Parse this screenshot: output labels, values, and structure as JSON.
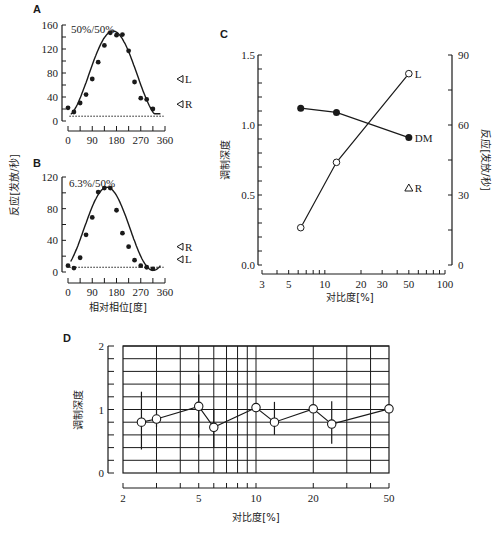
{
  "chart_data": [
    {
      "panel": "A",
      "type": "scatter",
      "title": "50%/50%",
      "xlabel": "相对相位[度]",
      "ylabel": "反应[发放/秒]",
      "xlim": [
        0,
        360
      ],
      "ylim": [
        0,
        160
      ],
      "xticks": [
        0,
        90,
        180,
        270,
        360
      ],
      "yticks": [
        0,
        40,
        80,
        120,
        160
      ],
      "points": {
        "x": [
          0,
          22,
          45,
          67,
          90,
          112,
          135,
          157,
          180,
          202,
          225,
          247,
          270,
          292,
          315
        ],
        "y": [
          22,
          15,
          30,
          44,
          70,
          98,
          126,
          147,
          143,
          144,
          117,
          65,
          38,
          36,
          20
        ]
      },
      "fit_curve": "sinusoid",
      "baseline_dotted": 8,
      "markers": [
        {
          "label": "L",
          "y": 70
        },
        {
          "label": "R",
          "y": 28
        }
      ]
    },
    {
      "panel": "B",
      "type": "scatter",
      "title": "6.3%/50%",
      "xlabel": "相对相位[度]",
      "ylabel": "反应[发放/秒]",
      "xlim": [
        0,
        360
      ],
      "ylim": [
        0,
        120
      ],
      "xticks": [
        0,
        90,
        180,
        270,
        360
      ],
      "yticks": [
        0,
        40,
        80,
        120
      ],
      "points": {
        "x": [
          0,
          22,
          45,
          67,
          90,
          112,
          135,
          157,
          180,
          202,
          225,
          247,
          270,
          292,
          315
        ],
        "y": [
          8,
          5,
          18,
          47,
          69,
          101,
          106,
          106,
          78,
          49,
          32,
          15,
          8,
          6,
          4
        ]
      },
      "fit_curve": "sinusoid",
      "baseline_dotted": 6,
      "markers": [
        {
          "label": "R",
          "y": 32
        },
        {
          "label": "L",
          "y": 16
        }
      ]
    },
    {
      "panel": "C",
      "type": "line",
      "xlabel": "对比度[%]",
      "ylabel_left": "调制深度",
      "ylabel_right": "反应[发放/秒]",
      "xscale": "log",
      "xlim": [
        3,
        100
      ],
      "xticks": [
        3,
        5,
        10,
        20,
        30,
        50,
        100
      ],
      "ylim_left": [
        0,
        1.5
      ],
      "yticks_left": [
        "0.0",
        "0.5",
        "1.0",
        "1.5"
      ],
      "ylim_right": [
        0,
        90
      ],
      "yticks_right": [
        0,
        30,
        60,
        90
      ],
      "series": [
        {
          "name": "DM",
          "marker": "filled-circle",
          "axis": "left",
          "x": [
            6.3,
            12.5,
            50
          ],
          "y": [
            1.12,
            1.09,
            0.91
          ]
        },
        {
          "name": "L",
          "marker": "open-circle",
          "axis": "right",
          "x": [
            6.3,
            12.5,
            50
          ],
          "y": [
            16,
            44,
            82
          ]
        },
        {
          "name": "R",
          "marker": "open-triangle",
          "axis": "right",
          "x": [
            50
          ],
          "y": [
            33
          ]
        }
      ]
    },
    {
      "panel": "D",
      "type": "line",
      "xlabel": "对比度[%]",
      "ylabel": "调制深度",
      "xscale": "log",
      "xlim": [
        2,
        50
      ],
      "xticks": [
        2,
        5,
        10,
        20,
        50
      ],
      "ylim": [
        0,
        2
      ],
      "yticks": [
        0,
        1,
        2
      ],
      "grid": true,
      "series": [
        {
          "name": "modulation depth",
          "marker": "open-circle",
          "x": [
            2.5,
            3,
            5,
            6,
            10,
            12.5,
            20,
            25,
            50
          ],
          "y": [
            0.8,
            0.85,
            1.05,
            0.72,
            1.03,
            0.8,
            1.01,
            0.77,
            1.01
          ],
          "err_low": [
            0.37,
            0.72,
            0.56,
            0.4,
            1.03,
            0.6,
            1.01,
            0.46,
            1.01
          ],
          "err_high": [
            1.28,
            1.0,
            1.55,
            1.01,
            1.03,
            1.12,
            1.01,
            1.13,
            1.01
          ]
        }
      ]
    }
  ],
  "labels": {
    "A": "A",
    "B": "B",
    "C": "C",
    "D": "D",
    "a_title": "50%/50%",
    "b_title": "6.3%/50%",
    "ab_ylabel": "反应[发放/秒]",
    "ab_xlabel": "相对相位[度]",
    "c_ylabel_left": "调制深度",
    "c_ylabel_right": "反应[发放/秒]",
    "c_xlabel": "对比度[%]",
    "d_ylabel": "调制深度",
    "d_xlabel": "对比度[%]",
    "c_series_L": "L",
    "c_series_DM": "DM",
    "c_series_R": "R",
    "a_marker_L": "L",
    "a_marker_R": "R",
    "b_marker_R": "R",
    "b_marker_L": "L"
  }
}
